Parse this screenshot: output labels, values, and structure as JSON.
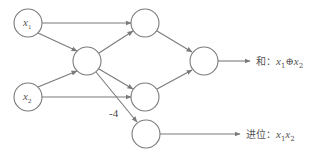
{
  "diagram": {
    "type": "neural-network",
    "nodes": [
      {
        "id": "x1",
        "label": "x",
        "sub": "1",
        "cx": 28,
        "cy": 23
      },
      {
        "id": "x2",
        "label": "x",
        "sub": "2",
        "cx": 28,
        "cy": 97
      },
      {
        "id": "h",
        "label": "",
        "cx": 87,
        "cy": 61
      },
      {
        "id": "m1",
        "label": "",
        "cx": 145,
        "cy": 23
      },
      {
        "id": "m2",
        "label": "",
        "cx": 145,
        "cy": 97
      },
      {
        "id": "c",
        "label": "",
        "cx": 146,
        "cy": 134
      },
      {
        "id": "o",
        "label": "",
        "cx": 204,
        "cy": 61
      }
    ],
    "edges": [
      {
        "from": "x1",
        "to": "m1"
      },
      {
        "from": "x1",
        "to": "h"
      },
      {
        "from": "x2",
        "to": "h"
      },
      {
        "from": "x2",
        "to": "m2"
      },
      {
        "from": "h",
        "to": "m1"
      },
      {
        "from": "h",
        "to": "m2"
      },
      {
        "from": "h",
        "to": "c",
        "weight": "-4"
      },
      {
        "from": "m1",
        "to": "o"
      },
      {
        "from": "m2",
        "to": "o"
      }
    ],
    "weight_label": "-4",
    "outputs": {
      "sum": {
        "prefix": "和：",
        "expr_a": "x",
        "sub_a": "1",
        "op": "⊕",
        "expr_b": "x",
        "sub_b": "2"
      },
      "carry": {
        "prefix": "进位：",
        "expr_a": "x",
        "sub_a": "1",
        "expr_b": "x",
        "sub_b": "2"
      }
    }
  }
}
